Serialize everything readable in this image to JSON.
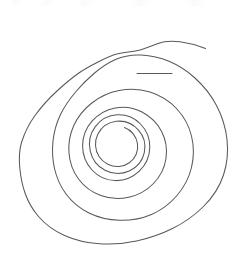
{
  "canvas": {
    "width": 242,
    "height": 262,
    "background_color": "#ffffff",
    "title": "Spiral Drawing"
  },
  "drawing": {
    "name": "hand-drawn-spiral",
    "description": "A single continuous hand-drawn spiral of roughly three and a half counter-clockwise turns, rendered as a thin dark-grey pen stroke on a plain white background.",
    "stroke_color": "#595959",
    "stroke_width": 1.05,
    "fill": "none",
    "turns": 3.5,
    "direction": "inward-counter-clockwise",
    "start_point": "205,48",
    "end_point": "128,138",
    "bounding_box": {
      "x": 19,
      "y": 40,
      "width": 209,
      "height": 205
    },
    "path": "M 205.5 48.5 C 198 45.5 189 43.0 180 41.8 C 172 40.8 164.5 41.0 158 43.5 C 151 46.2 145 49.0 138 50.5 C 131 52.0 124 52.3 117 54.0 C 110.5 55.6 105 58.4 99 61.5 C 92 65.1 85 68.6 78.5 73.2 C 71 78.5 64 84.5 57 91.0 C 49 98.4 41.5 106.5 35.0 115.5 C 29.0 123.8 24.5 132.8 21.5 142.5 C 19.0 150.8 19.0 159.5 19.8 168.0 C 20.6 176.5 22.2 185.0 25.0 193.0 C 28.0 201.6 32.5 209.5 38.5 216.5 C 45.5 224.7 54.5 231.0 64.5 235.5 C 75.5 240.4 87.5 243.0 99.5 243.8 C 112 244.6 124.5 243.6 136.5 241.0 C 149 238.3 161 234.2 172.5 228.5 C 184 222.8 194.5 215.4 203.5 206.5 C 212.5 197.6 219.5 187.0 223.5 175.0 C 227.3 163.6 228.3 151.5 227.0 139.5 C 225.7 127.5 222.0 116.0 216.5 105.5 C 211.0 95.0 203.5 85.8 195.0 78.0 C 187.0 70.7 178.0 65.0 168.5 61.0 C 159.8 57.3 150.5 55.5 141.0 55.0 C 132.0 54.5 123.5 56.0 115.5 59.5 C 107.5 63.0 100.5 68.0 94.0 73.5 C 87.5 79.0 81.5 85.0 76.0 91.5 C 70.0 98.6 64.5 106.2 60.5 114.5 C 56.5 122.9 54.0 131.8 53.0 141.0 C 52.0 150.3 52.5 159.6 54.5 168.5 C 56.6 177.8 60.5 186.5 66.0 194.0 C 72.0 202.2 80.0 208.5 89.0 213.0 C 98.5 217.7 109.0 220.0 119.5 220.3 C 130.5 220.6 141.5 218.8 151.5 214.5 C 161.5 210.2 170.0 203.6 177.0 195.5 C 184.0 187.4 189.0 177.8 191.5 167.5 C 194.0 157.2 194.0 146.4 191.5 136.0 C 189.0 125.7 183.8 116.3 176.5 108.5 C 169.3 100.8 160.0 95.2 150.0 92.0 C 140.0 88.8 129.3 88.5 119.0 90.5 C 109.0 92.4 99.8 96.8 91.8 103.0 C 84.0 109.1 77.8 116.8 73.8 125.5 C 69.8 134.2 68.2 143.8 69.0 153.2 C 69.8 162.6 73.0 171.6 78.5 179.0 C 84.2 186.6 92.0 192.3 100.8 195.5 C 109.8 198.8 119.6 199.3 128.8 197.3 C 138.2 195.2 146.8 190.4 153.5 183.5 C 160.2 176.6 164.6 167.8 166.0 158.5 C 167.4 149.2 165.8 139.6 161.5 131.3 C 157.2 123.0 150.2 116.3 142.0 112.0 C 133.8 107.7 124.3 106.3 115.2 108.0 C 106.2 109.7 98.0 114.4 92.0 121.2 C 86.0 128.0 82.6 136.8 82.6 145.8 C 82.6 154.8 86.0 163.5 92.0 170.0 C 98.0 176.5 106.5 180.4 115.3 180.6 C 124.2 180.8 132.9 177.3 139.3 171.2 C 145.8 165.0 149.6 156.4 149.8 147.6 C 150.0 138.8 146.6 130.2 140.5 124.0 C 134.4 117.8 125.8 114.3 117.2 114.8 C 108.6 115.3 100.5 119.7 95.3 126.6 C 90.2 133.5 88.3 142.5 90.2 150.8 C 92.0 159.1 97.5 166.3 105.0 170.2 C 112.5 174.1 121.6 174.4 129.2 171.0 C 136.8 167.6 142.5 160.7 144.3 152.6 C 146.0 144.6 143.8 135.9 138.3 129.8 C 132.8 123.7 124.5 120.4 116.5 121.3 C 108.5 122.2 101.3 127.2 97.8 134.3 C 94.3 141.4 94.8 150.2 99.2 156.8 C 103.6 163.3 111.3 167.1 119.0 166.5 C 126.6 165.9 133.3 161.1 136.2 154.2 C 139.0 147.4 137.8 139.4 133.2 133.8 C 130.8 130.9 127.8 128.8 124.5 127.6",
    "second_pass_highlight": "M 137 73.5 L 172 73.5"
  },
  "artifacts": {
    "top_edge_scan_noise": {
      "present": true,
      "description": "Faint near-white speckle band along the very top edge of the image"
    }
  }
}
